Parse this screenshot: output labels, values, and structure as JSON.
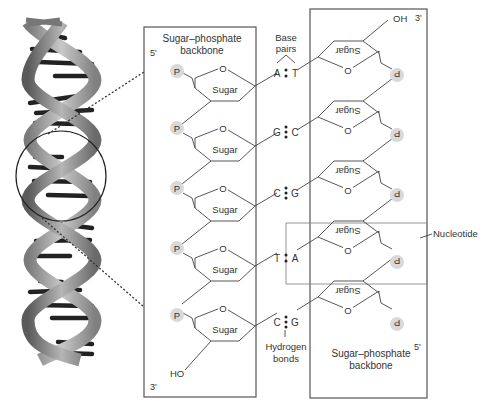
{
  "figure": {
    "left_strand": {
      "title_line1": "Sugar–phosphate",
      "title_line2": "backbone",
      "end_top": "5'",
      "end_bottom": "3'",
      "terminal_group": "HO",
      "phosphate_label": "P",
      "sugar_label": "Sugar",
      "ring_oxygen": "O"
    },
    "right_strand": {
      "title_line1": "Sugar–phosphate",
      "title_line2": "backbone",
      "end_top": "3'",
      "end_bottom": "5'",
      "terminal_group": "OH",
      "phosphate_label": "P",
      "sugar_label": "Sugar",
      "ring_oxygen": "O"
    },
    "base_pairs_label_line1": "Base",
    "base_pairs_label_line2": "pairs",
    "hydrogen_bonds_label_line1": "Hydrogen",
    "hydrogen_bonds_label_line2": "bonds",
    "nucleotide_label": "Nucleotide",
    "pairs": [
      {
        "left": "A",
        "right": "T",
        "bonds": 2
      },
      {
        "left": "G",
        "right": "C",
        "bonds": 3
      },
      {
        "left": "C",
        "right": "G",
        "bonds": 3
      },
      {
        "left": "T",
        "right": "A",
        "bonds": 2
      },
      {
        "left": "C",
        "right": "G",
        "bonds": 3
      }
    ],
    "colors": {
      "line": "#444444",
      "phosphate_fill": "#d9d9d9",
      "box_stroke": "#555555",
      "helix_dark": "#2a2a2a",
      "helix_light": "#9a9a9a"
    }
  }
}
